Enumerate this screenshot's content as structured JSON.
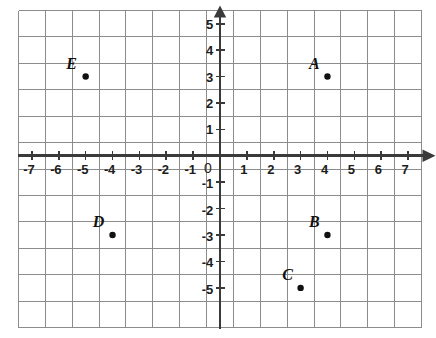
{
  "chart_data": {
    "type": "scatter",
    "title": "",
    "xlabel": "",
    "ylabel": "",
    "xlim": [
      -7.5,
      7.5
    ],
    "ylim": [
      -5.5,
      5.5
    ],
    "grid": true,
    "legend_position": "none",
    "x_ticks": [
      "-7",
      "-6",
      "-5",
      "-4",
      "-3",
      "-2",
      "-1",
      "1",
      "2",
      "3",
      "4",
      "5",
      "6",
      "7"
    ],
    "x_tick_values": [
      -7,
      -6,
      -5,
      -4,
      -3,
      -2,
      -1,
      1,
      2,
      3,
      4,
      5,
      6,
      7
    ],
    "y_ticks": [
      "5",
      "4",
      "3",
      "2",
      "1",
      "-1",
      "-2",
      "-3",
      "-4",
      "-5"
    ],
    "y_tick_values": [
      5,
      4,
      3,
      2,
      1,
      -1,
      -2,
      -3,
      -4,
      -5
    ],
    "origin_label": "0",
    "points": [
      {
        "label": "A",
        "x": 4,
        "y": 3,
        "label_dx": -13,
        "label_dy": -13
      },
      {
        "label": "B",
        "x": 4,
        "y": -3,
        "label_dx": -13,
        "label_dy": -13
      },
      {
        "label": "C",
        "x": 3,
        "y": -5,
        "label_dx": -13,
        "label_dy": -13
      },
      {
        "label": "D",
        "x": -4,
        "y": -3,
        "label_dx": -14,
        "label_dy": -13
      },
      {
        "label": "E",
        "x": -5,
        "y": 3,
        "label_dx": -14,
        "label_dy": -13
      }
    ],
    "colors": {
      "grid_line": "#8c8c8c",
      "grid_border": "#8c8c8c",
      "axis": "#3a3a3a",
      "point_fill": "#111111",
      "label_text": "#111111",
      "background": "#ffffff"
    },
    "point_radius": 3.2,
    "axis_has_arrows": true,
    "arrow_directions": [
      "up",
      "right"
    ]
  }
}
